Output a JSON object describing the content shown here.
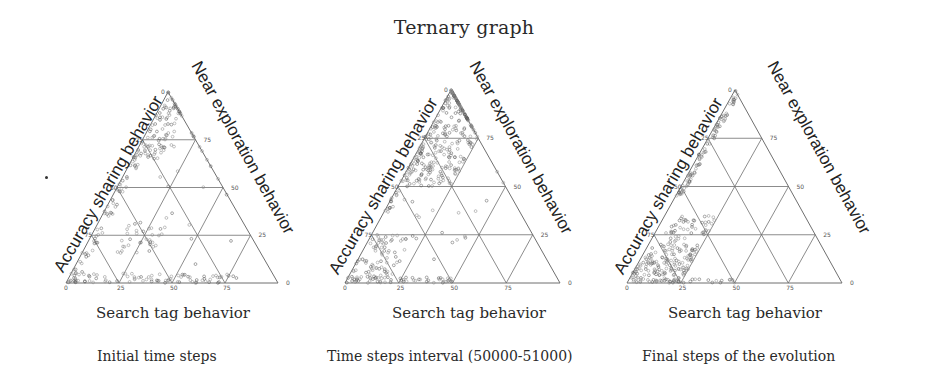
{
  "figure": {
    "title": "Ternary graph"
  },
  "panels": [
    {
      "left_axis_label": "Accuracy sharing behavior",
      "right_axis_label": "Near exploration behavior",
      "bottom_axis_label": "Search tag behavior",
      "caption": "Initial time steps"
    },
    {
      "left_axis_label": "Accuracy sharing behavior",
      "right_axis_label": "Near exploration behavior",
      "bottom_axis_label": "Search tag behavior",
      "caption": "Time steps interval (50000-51000)"
    },
    {
      "left_axis_label": "Accuracy sharing behavior",
      "right_axis_label": "Near exploration behavior",
      "bottom_axis_label": "Search tag behavior",
      "caption": "Final steps of the evolution"
    }
  ],
  "colors": {
    "grid": "#6f6f6f",
    "point": "#8a8a8a",
    "point_dark": "#5a5a5a"
  },
  "chart_data": [
    {
      "type": "scatter",
      "subtype": "ternary",
      "title": "Initial time steps",
      "axes": {
        "left": "Accuracy sharing behavior",
        "right": "Near exploration behavior",
        "bottom": "Search tag behavior"
      },
      "ticks": {
        "left": [
          "0",
          "25",
          "50",
          "75"
        ],
        "right": [
          "0",
          "25",
          "50",
          "75"
        ],
        "bottom": [
          "0",
          "25",
          "50",
          "75"
        ]
      },
      "range": [
        0,
        100
      ],
      "grid": true,
      "clusters": [
        {
          "description": "near apex, along right edge",
          "search": [
            0,
            15
          ],
          "accuracy": [
            0,
            35
          ],
          "count": 90
        },
        {
          "description": "along left edge",
          "search": [
            0,
            5
          ],
          "accuracy": [
            30,
            100
          ],
          "count": 70
        },
        {
          "description": "along bottom edge",
          "search": [
            0,
            80
          ],
          "accuracy": [
            95,
            100
          ],
          "count": 80
        },
        {
          "description": "interior lower-left cluster",
          "search": [
            15,
            35
          ],
          "accuracy": [
            70,
            85
          ],
          "count": 30
        },
        {
          "description": "scattered interior",
          "search": [
            5,
            70
          ],
          "accuracy": [
            20,
            95
          ],
          "count": 25
        }
      ]
    },
    {
      "type": "scatter",
      "subtype": "ternary",
      "title": "Time steps interval (50000-51000)",
      "axes": {
        "left": "Accuracy sharing behavior",
        "right": "Near exploration behavior",
        "bottom": "Search tag behavior"
      },
      "ticks": {
        "left": [
          "0",
          "25",
          "50",
          "75"
        ],
        "right": [
          "0",
          "25",
          "50",
          "75"
        ],
        "bottom": [
          "0",
          "25",
          "50",
          "75"
        ]
      },
      "range": [
        0,
        100
      ],
      "grid": true,
      "clusters": [
        {
          "description": "dense upper region near apex",
          "search": [
            0,
            25
          ],
          "accuracy": [
            0,
            50
          ],
          "count": 260
        },
        {
          "description": "along right edge",
          "search": [
            0,
            3
          ],
          "accuracy": [
            0,
            65
          ],
          "count": 60
        },
        {
          "description": "lower-left corner fan",
          "search": [
            0,
            20
          ],
          "accuracy": [
            75,
            100
          ],
          "count": 80
        },
        {
          "description": "along bottom edge",
          "search": [
            0,
            50
          ],
          "accuracy": [
            97,
            100
          ],
          "count": 50
        },
        {
          "description": "scattered interior",
          "search": [
            5,
            50
          ],
          "accuracy": [
            40,
            90
          ],
          "count": 25
        }
      ]
    },
    {
      "type": "scatter",
      "subtype": "ternary",
      "title": "Final steps of the evolution",
      "axes": {
        "left": "Accuracy sharing behavior",
        "right": "Near exploration behavior",
        "bottom": "Search tag behavior"
      },
      "ticks": {
        "left": [
          "0",
          "25",
          "50",
          "75"
        ],
        "right": [
          "0",
          "25",
          "50",
          "75"
        ],
        "bottom": [
          "0",
          "25",
          "50",
          "75"
        ]
      },
      "range": [
        0,
        100
      ],
      "grid": true,
      "clusters": [
        {
          "description": "along right edge from apex to 50",
          "search": [
            0,
            3
          ],
          "accuracy": [
            0,
            55
          ],
          "count": 90
        },
        {
          "description": "lower-left corner dense cluster",
          "search": [
            0,
            25
          ],
          "accuracy": [
            80,
            100
          ],
          "count": 160
        },
        {
          "description": "band near 70-80 accuracy",
          "search": [
            5,
            25
          ],
          "accuracy": [
            65,
            80
          ],
          "count": 50
        },
        {
          "description": "along bottom edge",
          "search": [
            0,
            50
          ],
          "accuracy": [
            98,
            100
          ],
          "count": 30
        }
      ]
    }
  ]
}
